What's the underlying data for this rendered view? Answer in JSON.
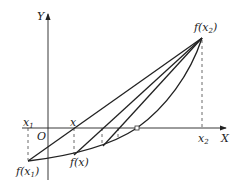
{
  "diagram": {
    "axes": {
      "x_label": "X",
      "y_label": "Y",
      "origin_label": "O"
    },
    "labels": {
      "x1": "x",
      "x1_sub": "1",
      "x": "x",
      "x2": "x",
      "x2_sub": "2",
      "fx1": "f(x",
      "fx1_sub": "1",
      "fx1_close": ")",
      "fx": "f(x)",
      "fx2": "f(x",
      "fx2_sub": "2",
      "fx2_close": ")"
    },
    "colors": {
      "stroke": "#222222",
      "dashed": "#444444"
    }
  }
}
